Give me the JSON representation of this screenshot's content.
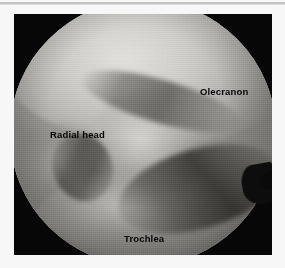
{
  "figure": {
    "type": "arthroscopic-photograph",
    "modality": "elbow arthroscopy",
    "view": "circular scope field",
    "colors": {
      "page_background": "#f7f7f7",
      "frame": "#070707",
      "label_text": "#050505",
      "rule": "#b9b9b9"
    }
  },
  "labels": [
    {
      "id": "olecranon",
      "text": "Olecranon",
      "position": "upper-right"
    },
    {
      "id": "radial-head",
      "text": "Radial head",
      "position": "mid-left"
    },
    {
      "id": "trochlea",
      "text": "Trochlea",
      "position": "bottom-center"
    }
  ]
}
